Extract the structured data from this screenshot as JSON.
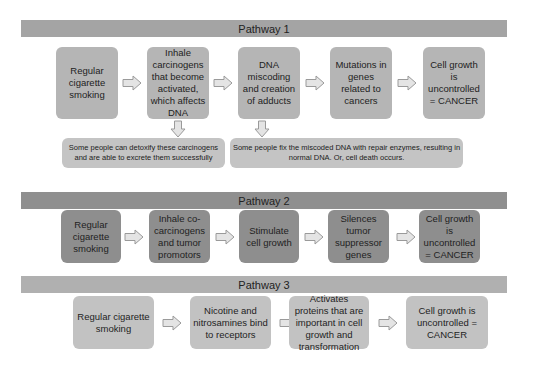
{
  "pathways": [
    {
      "title": "Pathway 1",
      "steps": [
        "Regular cigarette smoking",
        "Inhale carcinogens that become activated, which affects DNA",
        "DNA miscoding and creation of adducts",
        "Mutations in genes related to cancers",
        "Cell growth is uncontrolled = CANCER"
      ],
      "notes": [
        "Some people can detoxify these carcinogens and are able to excrete them successfully",
        "Some people fix the miscoded DNA with repair enzymes, resulting in normal DNA. Or, cell death occurs."
      ]
    },
    {
      "title": "Pathway 2",
      "steps": [
        "Regular cigarette smoking",
        "Inhale co-carcinogens and tumor promotors",
        "Stimulate cell growth",
        "Silences tumor suppressor genes",
        "Cell growth is uncontrolled = CANCER"
      ]
    },
    {
      "title": "Pathway 3",
      "steps": [
        "Regular cigarette smoking",
        "Nicotine and nitrosamines bind to receptors",
        "Activates proteins that are important in cell growth and transformation",
        "Cell growth is uncontrolled = CANCER"
      ]
    }
  ],
  "colors": {
    "pathway1_bar": "#a4a4a4",
    "pathway1_box": "#b5b5b5",
    "pathway2_bar": "#8f8f8f",
    "pathway2_box": "#8e8e8e",
    "pathway3_bar": "#b0b0b0",
    "pathway3_box": "#c2c2c2",
    "note_box": "#c4c4c4",
    "arrow_fill": "#e4e4e4",
    "arrow_stroke": "#9a9a9a"
  }
}
